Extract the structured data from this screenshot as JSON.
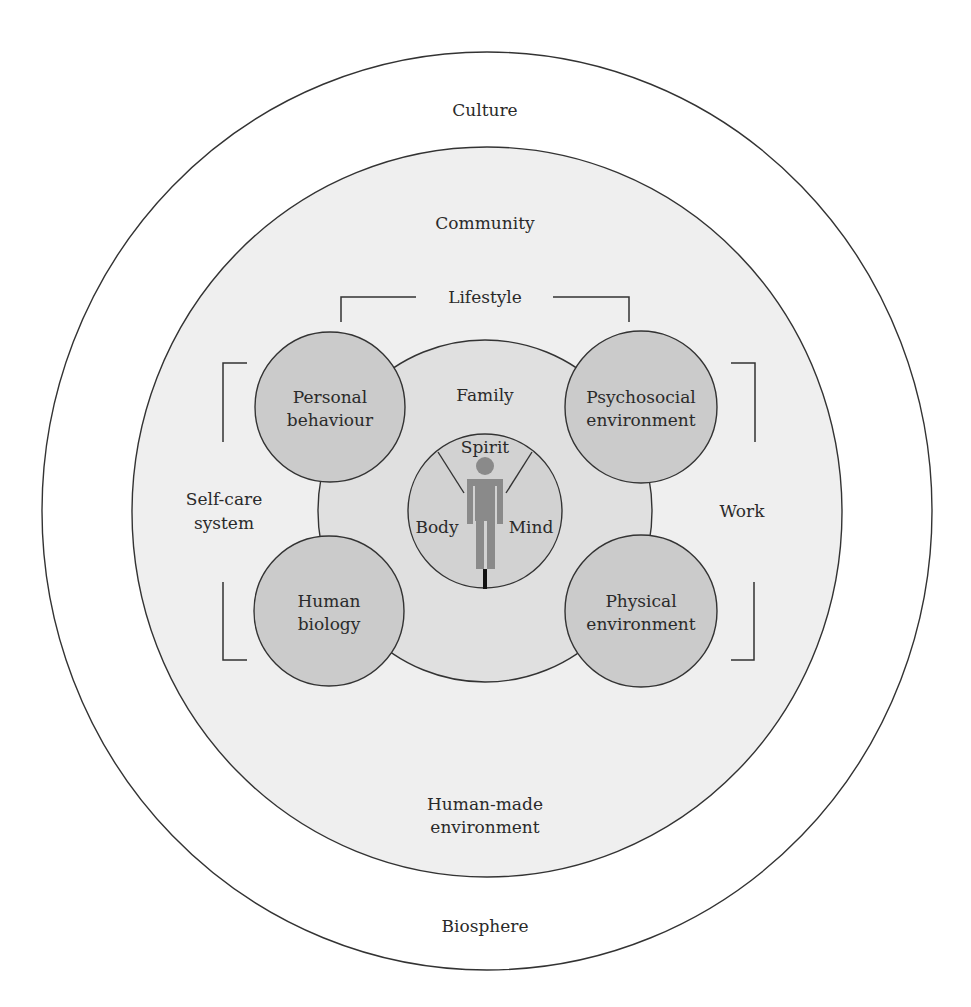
{
  "diagram": {
    "type": "concentric-model",
    "colors": {
      "background": "#ffffff",
      "community_fill": "#efefef",
      "family_fill": "#e0e0e0",
      "determinant_circle_fill": "#cbcbcb",
      "core_circle_fill": "#d2d2d2",
      "figure_fill": "#8a8a8a",
      "outline": "#333333"
    },
    "rings": {
      "outer_top": "Culture",
      "outer_bottom": "Biosphere",
      "community_top": "Community",
      "community_bottom_line1": "Human-made",
      "community_bottom_line2": "environment",
      "family": "Family"
    },
    "brackets": {
      "top": "Lifestyle",
      "left_line1": "Self-care",
      "left_line2": "system",
      "right": "Work"
    },
    "determinants": [
      {
        "line1": "Personal",
        "line2": "behaviour"
      },
      {
        "line1": "Psychosocial",
        "line2": "environment"
      },
      {
        "line1": "Human",
        "line2": "biology"
      },
      {
        "line1": "Physical",
        "line2": "environment"
      }
    ],
    "core": {
      "top": "Spirit",
      "left": "Body",
      "right": "Mind",
      "figure_icon": "person-icon"
    }
  }
}
